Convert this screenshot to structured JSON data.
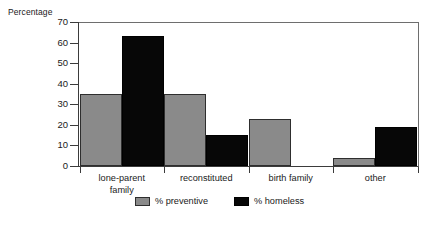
{
  "chart_data": {
    "type": "bar",
    "title": "",
    "subtitle": "",
    "xlabel": "",
    "ylabel": "Percentage",
    "ylim": [
      0,
      70
    ],
    "yticks": [
      0,
      10,
      20,
      30,
      40,
      50,
      60,
      70
    ],
    "grid": false,
    "legend_position": "bottom-center",
    "categories": [
      "lone-parent family",
      "reconstituted",
      "birth family",
      "other"
    ],
    "category_lines": [
      [
        "lone-parent",
        "family"
      ],
      [
        "reconstituted"
      ],
      [
        "birth family"
      ],
      [
        "other"
      ]
    ],
    "series": [
      {
        "name": "% preventive",
        "color": "#8a8a8a",
        "values": [
          35,
          35,
          23,
          4
        ]
      },
      {
        "name": "% homeless",
        "color": "#070707",
        "values": [
          63,
          15,
          0,
          19
        ]
      }
    ]
  }
}
